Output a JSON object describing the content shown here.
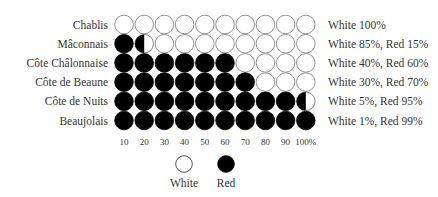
{
  "chart_data": {
    "type": "pictograph",
    "title": "",
    "unit_percent_per_symbol": 10,
    "categories": [
      "Chablis",
      "Mâconnais",
      "Côte Châlonnaise",
      "Côte de Beaune",
      "Côte de Nuits",
      "Beaujolais"
    ],
    "series": [
      {
        "name": "Red",
        "color": "#000000",
        "values": [
          0,
          15,
          60,
          70,
          95,
          99
        ]
      },
      {
        "name": "White",
        "color": "#ffffff",
        "values": [
          100,
          85,
          40,
          30,
          5,
          1
        ]
      }
    ],
    "row_annotations": [
      "White 100%",
      "White 85%, Red 15%",
      "White 40%, Red 60%",
      "White 30%, Red 70%",
      "White 5%, Red 95%",
      "White 1%, Red 99%"
    ],
    "x_tick_labels": [
      "10",
      "20",
      "30",
      "40",
      "50",
      "60",
      "70",
      "80",
      "90",
      "100%"
    ],
    "xlim": [
      0,
      100
    ],
    "legend": {
      "position": "bottom",
      "entries": [
        {
          "label": "White",
          "fill": "#ffffff",
          "stroke": "#444444"
        },
        {
          "label": "Red",
          "fill": "#000000",
          "stroke": "#000000"
        }
      ]
    },
    "grid": false
  }
}
